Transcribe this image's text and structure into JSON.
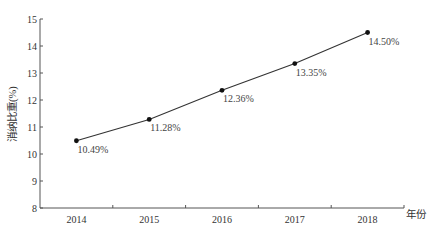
{
  "chart_data": {
    "type": "line",
    "title": "",
    "xlabel": "年份",
    "ylabel": "消纳比重(%)",
    "categories": [
      "2014",
      "2015",
      "2016",
      "2017",
      "2018"
    ],
    "series": [
      {
        "name": "消纳比重",
        "values": [
          10.49,
          11.28,
          12.36,
          13.35,
          14.5
        ],
        "labels": [
          "10.49%",
          "11.28%",
          "12.36%",
          "13.35%",
          "14.50%"
        ],
        "color": "#333333",
        "marker": "circle"
      }
    ],
    "ylim": [
      8,
      15
    ],
    "yticks": [
      8,
      9,
      10,
      11,
      12,
      13,
      14,
      15
    ],
    "grid": false,
    "legend": "none"
  },
  "layout": {
    "plot_left": 40,
    "plot_right": 404,
    "plot_top": 19,
    "plot_bottom": 208,
    "axis_color": "#555555",
    "line_color": "#333333"
  }
}
